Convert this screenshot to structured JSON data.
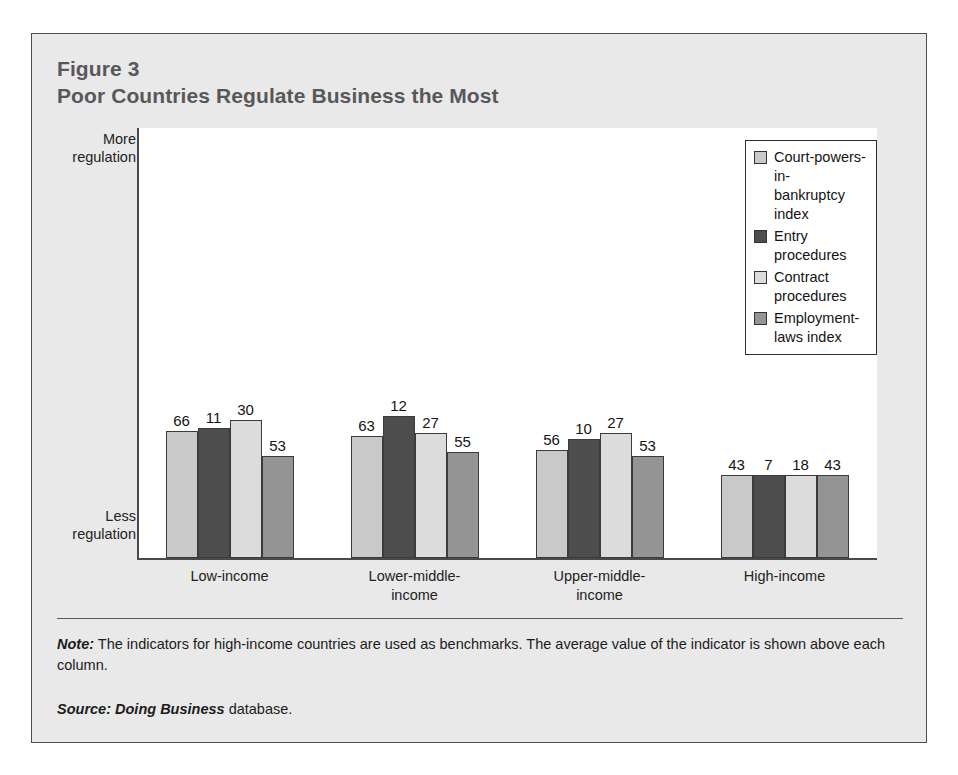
{
  "figure": {
    "number_label": "Figure 3",
    "title": "Poor Countries Regulate Business the Most"
  },
  "axis": {
    "top_label_line1": "More",
    "top_label_line2": "regulation",
    "bottom_label_line1": "Less",
    "bottom_label_line2": "regulation"
  },
  "legend": {
    "entries": [
      {
        "label_line1": "Court-powers-in-",
        "label_line2": "bankruptcy index",
        "color": "#c9c9c9"
      },
      {
        "label_line1": "Entry procedures",
        "label_line2": "",
        "color": "#4d4d4d"
      },
      {
        "label_line1": "Contract procedures",
        "label_line2": "",
        "color": "#dcdcdc"
      },
      {
        "label_line1": "Employment-laws index",
        "label_line2": "",
        "color": "#949494"
      }
    ]
  },
  "notes": {
    "note_lead": "Note:",
    "note_text": " The indicators for high-income countries are used as benchmarks. The average value of the indicator is shown above each column.",
    "source_lead": "Source:",
    "source_em": " Doing Business",
    "source_text": " database."
  },
  "chart_data": {
    "type": "bar",
    "title": "Poor Countries Regulate Business the Most",
    "subtitle": "Figure 3",
    "xlabel": "",
    "ylabel": "Regulation (benchmarked to high-income countries)",
    "grid": false,
    "legend_position": "top-right",
    "y_axis_top_label": "More regulation",
    "y_axis_bottom_label": "Less regulation",
    "categories": [
      {
        "line1": "Low-income",
        "line2": ""
      },
      {
        "line1": "Lower-middle-",
        "line2": "income"
      },
      {
        "line1": "Upper-middle-",
        "line2": "income"
      },
      {
        "line1": "High-income",
        "line2": ""
      }
    ],
    "category_names": [
      "Low-income",
      "Lower-middle-income",
      "Upper-middle-income",
      "High-income"
    ],
    "series": [
      {
        "name": "Court-powers-in-bankruptcy index",
        "color": "#c9c9c9",
        "values": [
          66,
          63,
          56,
          43
        ]
      },
      {
        "name": "Entry procedures",
        "color": "#4d4d4d",
        "values": [
          11,
          12,
          10,
          7
        ]
      },
      {
        "name": "Contract procedures",
        "color": "#dcdcdc",
        "values": [
          30,
          27,
          27,
          18
        ]
      },
      {
        "name": "Employment-laws index",
        "color": "#949494",
        "values": [
          53,
          55,
          53,
          43
        ]
      }
    ],
    "benchmark_category": "High-income",
    "bar_heights_relative": {
      "note": "Bar heights are drawn relative to the high-income benchmark bar of each series (benchmark = 1.0)",
      "Court-powers-in-bankruptcy index": [
        1.535,
        1.465,
        1.302,
        1.0
      ],
      "Entry procedures": [
        1.571,
        1.714,
        1.429,
        1.0
      ],
      "Contract procedures": [
        1.667,
        1.5,
        1.5,
        1.0
      ],
      "Employment-laws index": [
        1.233,
        1.279,
        1.233,
        1.0
      ]
    }
  }
}
